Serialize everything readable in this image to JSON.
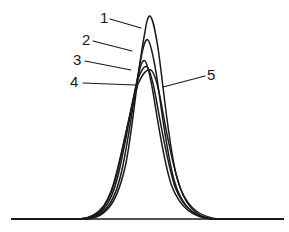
{
  "figure": {
    "background_color": "#ffffff",
    "line_color": "#1a1a1a",
    "width": 289,
    "height": 232,
    "labels": [
      {
        "id": "1",
        "text": "1",
        "x": 100,
        "y": 10
      },
      {
        "id": "2",
        "text": "2",
        "x": 82,
        "y": 32
      },
      {
        "id": "3",
        "text": "3",
        "x": 73,
        "y": 52
      },
      {
        "id": "4",
        "text": "4",
        "x": 70,
        "y": 74
      },
      {
        "id": "5",
        "text": "5",
        "x": 207,
        "y": 67
      }
    ],
    "leaders": [
      {
        "id": "leader-1",
        "d": "M 110 19 L 141 28"
      },
      {
        "id": "leader-2",
        "d": "M 93 41 L 132 51"
      },
      {
        "id": "leader-3",
        "d": "M 85 61 L 131 70"
      },
      {
        "id": "leader-4",
        "d": "M 83 83 L 135 85"
      },
      {
        "id": "leader-5",
        "d": "M 205 76 L 163 87"
      }
    ],
    "baseline": {
      "d": "M 12 219 L 283 219"
    }
  },
  "chart_data": {
    "type": "line",
    "title": "",
    "xlabel": "",
    "ylabel": "",
    "grid": false,
    "legend_position": "inline-labels",
    "axis_visible": false,
    "baseline_y": 219,
    "x_range": [
      12,
      283
    ],
    "y_range": [
      15,
      219
    ],
    "series": [
      {
        "name": "1",
        "label": "1",
        "peak_x": 148,
        "peak_y": 15,
        "peak_height": 204,
        "relative_height": 1.0,
        "half_width": 26,
        "path": "M 12 219 L 86 219 C 108 218 118 200 126 163 C 133 128 138 66 145 32 C 146 24 148 15 150 16 C 153 18 155 30 158 48 C 163 82 168 140 176 174 C 184 206 196 218 214 219 L 283 219"
      },
      {
        "name": "2",
        "label": "2",
        "peak_x": 145,
        "peak_y": 39,
        "peak_height": 180,
        "relative_height": 0.88,
        "half_width": 27,
        "path": "M 12 219 L 84 219 C 106 218 116 200 123 165 C 130 131 136 82 142 53 C 144 44 146 38 148 40 C 151 43 153 55 156 72 C 161 104 166 150 174 180 C 182 208 195 218 213 219 L 283 219"
      },
      {
        "name": "3",
        "label": "3",
        "peak_x": 142,
        "peak_y": 60,
        "peak_height": 159,
        "relative_height": 0.78,
        "half_width": 28,
        "path": "M 12 219 L 82 219 C 104 218 113 200 120 167 C 127 136 133 96 139 72 C 141 64 143 59 145 61 C 148 64 150 76 153 92 C 158 122 163 158 171 184 C 180 209 194 218 212 219 L 283 219"
      },
      {
        "name": "4",
        "label": "4",
        "peak_x": 146,
        "peak_y": 66,
        "peak_height": 153,
        "relative_height": 0.75,
        "half_width": 29,
        "path": "M 12 219 L 80 219 C 102 218 111 200 118 169 C 125 140 132 102 138 79 C 141 71 144 65 147 67 C 150 70 153 82 156 98 C 161 126 167 162 175 187 C 184 210 197 218 215 219 L 283 219"
      },
      {
        "name": "5",
        "label": "5",
        "peak_x": 150,
        "peak_y": 69,
        "peak_height": 150,
        "relative_height": 0.74,
        "half_width": 31,
        "path": "M 12 219 L 79 219 C 101 218 110 201 117 171 C 124 143 131 107 138 84 C 142 75 146 68 151 70 C 155 73 158 86 161 102 C 166 130 172 166 181 190 C 190 211 203 218 221 219 L 283 219"
      }
    ]
  }
}
